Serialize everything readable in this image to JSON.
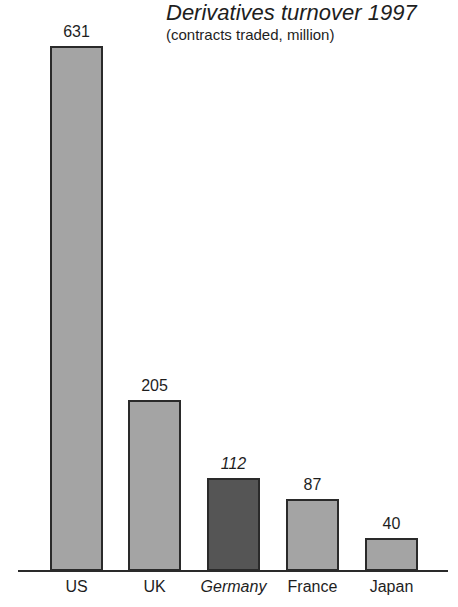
{
  "chart_data": {
    "type": "bar",
    "title": "Derivatives turnover 1997",
    "subtitle": "(contracts traded, million)",
    "categories": [
      "US",
      "UK",
      "Germany",
      "France",
      "Japan"
    ],
    "values": [
      631,
      205,
      112,
      87,
      40
    ],
    "value_labels": [
      "631",
      "205",
      "112",
      "87",
      "40"
    ],
    "highlighted": "Germany",
    "xlabel": "",
    "ylabel": "",
    "ylim": [
      0,
      631
    ],
    "grid": false,
    "colors": {
      "bar": "#a4a4a4",
      "highlight": "#555555",
      "outline": "#2a2a2a"
    }
  }
}
